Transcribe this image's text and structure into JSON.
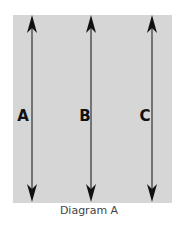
{
  "diagram": {
    "background_color": "#d6d6d6",
    "arrow_color": "#111111",
    "arrows": [
      {
        "label": "A",
        "x": 32,
        "label_x": 23
      },
      {
        "label": "B",
        "x": 91,
        "label_x": 85
      },
      {
        "label": "C",
        "x": 152,
        "label_x": 145
      }
    ],
    "caption": "Diagram A"
  }
}
